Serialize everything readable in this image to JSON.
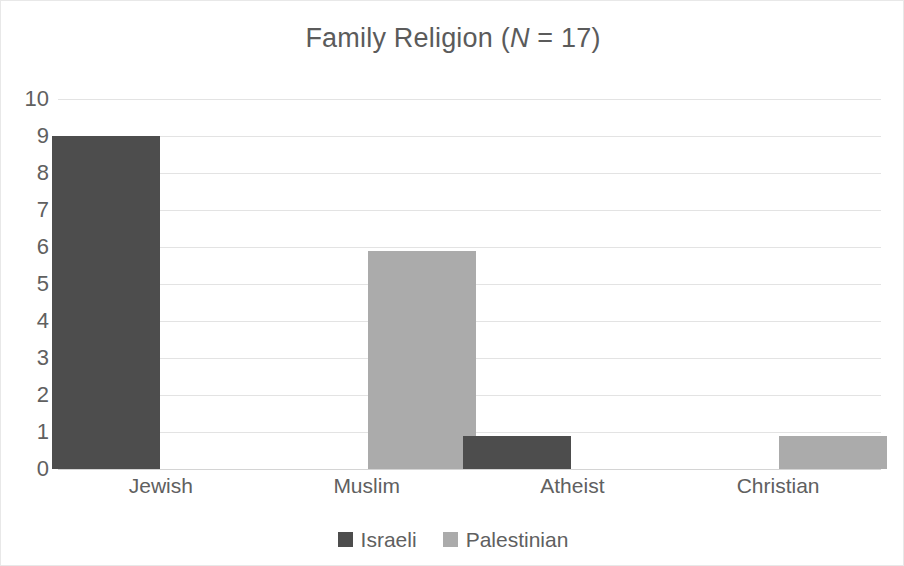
{
  "chart_data": {
    "type": "bar",
    "title": "Family Religion (N = 17)",
    "title_prefix": "Family Religion (",
    "title_italic": "N",
    "title_suffix": " = 17)",
    "xlabel": "",
    "ylabel": "",
    "categories": [
      "Jewish",
      "Muslim",
      "Atheist",
      "Christian"
    ],
    "series": [
      {
        "name": "Israeli",
        "color": "#4d4d4d",
        "values": [
          9,
          0,
          0.9,
          0
        ]
      },
      {
        "name": "Palestinian",
        "color": "#ababab",
        "values": [
          0,
          5.9,
          0,
          0.9
        ]
      }
    ],
    "ylim": [
      0,
      10
    ],
    "ytick_step": 1,
    "ytick_labels": [
      "10",
      "9",
      "8",
      "7",
      "6",
      "5",
      "4",
      "3",
      "2",
      "1",
      "0"
    ],
    "grid": true,
    "grid_axis": "y",
    "grid_color": "#e3e3e3",
    "legend_position": "bottom",
    "background": "#ffffff",
    "border_color": "#e8e8e8",
    "text_color": "#606060"
  }
}
